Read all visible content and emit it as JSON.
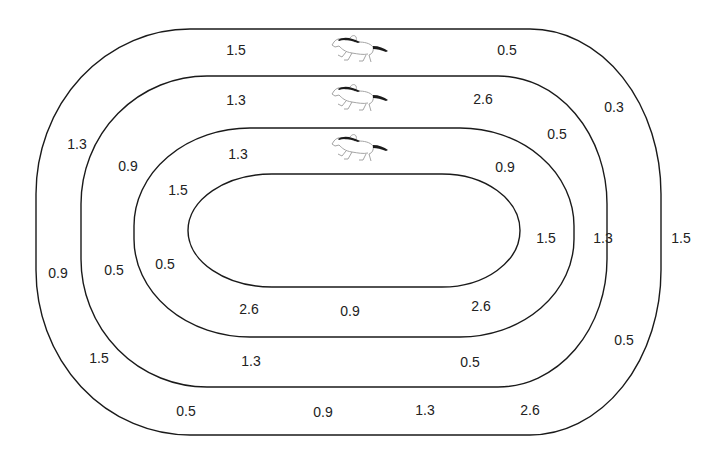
{
  "diagram": {
    "type": "race-track-lanes",
    "horse_icon": "racing-horse-icon",
    "lanes": [
      {
        "name": "outer-lane",
        "values": [
          {
            "text": "1.5",
            "x": 236,
            "y": 50
          },
          {
            "text": "0.5",
            "x": 507,
            "y": 50
          },
          {
            "text": "0.3",
            "x": 614,
            "y": 107
          },
          {
            "text": "1.5",
            "x": 681,
            "y": 238
          },
          {
            "text": "0.5",
            "x": 624,
            "y": 340
          },
          {
            "text": "2.6",
            "x": 530,
            "y": 410
          },
          {
            "text": "1.3",
            "x": 425,
            "y": 410
          },
          {
            "text": "0.9",
            "x": 323,
            "y": 412
          },
          {
            "text": "0.5",
            "x": 186,
            "y": 411
          },
          {
            "text": "1.5",
            "x": 99,
            "y": 358
          },
          {
            "text": "0.9",
            "x": 58,
            "y": 273
          },
          {
            "text": "1.3",
            "x": 77,
            "y": 144
          }
        ]
      },
      {
        "name": "middle-lane",
        "values": [
          {
            "text": "1.3",
            "x": 236,
            "y": 100
          },
          {
            "text": "2.6",
            "x": 483,
            "y": 99
          },
          {
            "text": "0.5",
            "x": 557,
            "y": 134
          },
          {
            "text": "1.3",
            "x": 603,
            "y": 238
          },
          {
            "text": "0.5",
            "x": 470,
            "y": 362
          },
          {
            "text": "1.3",
            "x": 251,
            "y": 361
          },
          {
            "text": "0.5",
            "x": 114,
            "y": 270
          },
          {
            "text": "0.9",
            "x": 128,
            "y": 166
          }
        ]
      },
      {
        "name": "inner-lane",
        "values": [
          {
            "text": "1.3",
            "x": 238,
            "y": 154
          },
          {
            "text": "0.9",
            "x": 505,
            "y": 167
          },
          {
            "text": "1.5",
            "x": 546,
            "y": 238
          },
          {
            "text": "2.6",
            "x": 481,
            "y": 306
          },
          {
            "text": "0.9",
            "x": 350,
            "y": 311
          },
          {
            "text": "2.6",
            "x": 249,
            "y": 309
          },
          {
            "text": "0.5",
            "x": 165,
            "y": 264
          },
          {
            "text": "1.5",
            "x": 178,
            "y": 190
          }
        ]
      }
    ],
    "horses": [
      {
        "lane": "outer-lane",
        "x": 330,
        "y": 33
      },
      {
        "lane": "middle-lane",
        "x": 330,
        "y": 82
      },
      {
        "lane": "inner-lane",
        "x": 330,
        "y": 132
      }
    ],
    "colors": {
      "line": "#1a1a1a",
      "text": "#222222",
      "horse_body": "#9a9a9a",
      "horse_mane": "#1a1a1a"
    }
  }
}
